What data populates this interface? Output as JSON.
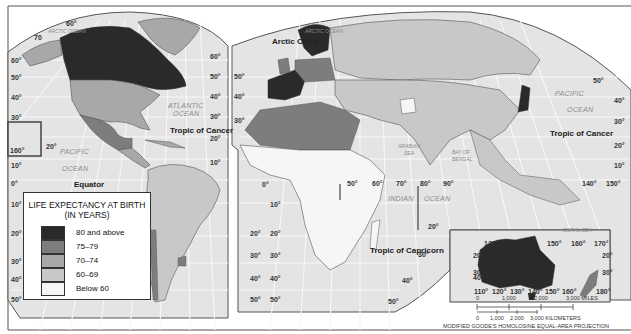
{
  "map": {
    "title": "Life Expectancy at Birth",
    "projection_label": "MODIFIED GOODE'S HOMOLOSINE EQUAL-AREA PROJECTION",
    "colors": {
      "ocean": "#e4e4e4",
      "grid": "#f7f7f7",
      "border": "#555555",
      "frame": "#555555"
    }
  },
  "legend": {
    "title_line1": "LIFE EXPECTANCY AT BIRTH",
    "title_line2": "(IN YEARS)",
    "items": [
      {
        "label": "80 and above",
        "color": "#2a2a2a"
      },
      {
        "label": "75–79",
        "color": "#7d7d7d"
      },
      {
        "label": "70–74",
        "color": "#a8a8a8"
      },
      {
        "label": "60–69",
        "color": "#c8c8c8"
      },
      {
        "label": "Below 60",
        "color": "#f6f6f6"
      }
    ]
  },
  "labels": {
    "oceans": {
      "arctic_left": "ARCTIC OCEAN",
      "arctic_right": "ARCTIC OCEAN",
      "atlantic_1": "ATLANTIC",
      "atlantic_2": "OCEAN",
      "pacific_left_1": "PACIFIC",
      "pacific_left_2": "OCEAN",
      "pacific_right_1": "PACIFIC",
      "pacific_right_2": "OCEAN",
      "indian_1": "INDIAN",
      "indian_2": "OCEAN",
      "arabian_1": "ARABIAN",
      "arabian_2": "SEA",
      "bengal_1": "BAY OF",
      "bengal_2": "BENGAL",
      "coral_sea": "CORAL SEA"
    },
    "lines": {
      "arctic_circle": "Arctic Circle",
      "tropic_cancer_left": "Tropic of Cancer",
      "tropic_cancer_right": "Tropic of Cancer",
      "equator": "Equator",
      "tropic_capricorn": "Tropic of Capricorn"
    },
    "latitudes_left": [
      "60°",
      "50°",
      "40°",
      "30°",
      "20°",
      "10°",
      "0°",
      "10°",
      "20°",
      "30°",
      "40°",
      "50°"
    ],
    "latitudes_mid_left": [
      "60°",
      "50°",
      "40°",
      "30°",
      "20°",
      "10°",
      "20°",
      "30°",
      "40°",
      "50°"
    ],
    "latitudes_mid_right": [
      "50°",
      "40°",
      "30°",
      "0°",
      "10°",
      "20°",
      "30°",
      "40°",
      "50°"
    ],
    "latitudes_right": [
      "50°",
      "40°",
      "30°",
      "20°",
      "10°",
      "20°",
      "30°",
      "40°",
      "50°"
    ],
    "longitudes_top": [
      "60°",
      "70"
    ],
    "longitudes_eq": [
      "50°",
      "60°",
      "70°",
      "80°",
      "90°",
      "140°",
      "150°"
    ],
    "hawaii": {
      "lon": "160°",
      "lat": "20°"
    },
    "australia_inset": {
      "top_lon": [
        "120°",
        "150°",
        "160°",
        "170°"
      ],
      "bottom_lon": [
        "110°",
        "120°",
        "130°",
        "140°",
        "150°",
        "160°",
        "180°"
      ],
      "lat_left": [
        "20°",
        "30°",
        "40°"
      ],
      "lat_right": [
        "20°",
        "30°"
      ]
    }
  },
  "scale": {
    "miles": [
      "0",
      "1,000",
      "2,000",
      "3,000 MILES"
    ],
    "km": [
      "0",
      "1,000",
      "2,000",
      "3,000 KILOMETERS"
    ]
  }
}
